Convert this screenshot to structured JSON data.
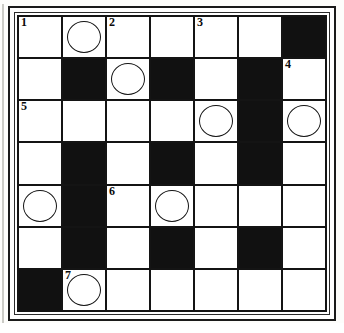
{
  "puzzle": {
    "title": "Crossword Grid",
    "type": "crossword",
    "rows": 7,
    "cols": 7,
    "colors": {
      "block": "#111111",
      "open": "#ffffff",
      "rule": "#141414",
      "number": "#0b0b0b"
    },
    "clue_numbers_visible": [
      "1",
      "2",
      "3",
      "4",
      "5",
      "6",
      "7"
    ],
    "cells": [
      [
        {
          "state": "open",
          "number": "1",
          "circled": false
        },
        {
          "state": "open",
          "number": "",
          "circled": true
        },
        {
          "state": "open",
          "number": "2",
          "circled": false
        },
        {
          "state": "open",
          "number": "",
          "circled": false
        },
        {
          "state": "open",
          "number": "3",
          "circled": false
        },
        {
          "state": "open",
          "number": "",
          "circled": false
        },
        {
          "state": "block",
          "number": "",
          "circled": false
        }
      ],
      [
        {
          "state": "open",
          "number": "",
          "circled": false
        },
        {
          "state": "block",
          "number": "",
          "circled": false
        },
        {
          "state": "open",
          "number": "",
          "circled": true
        },
        {
          "state": "block",
          "number": "",
          "circled": false
        },
        {
          "state": "open",
          "number": "",
          "circled": false
        },
        {
          "state": "block",
          "number": "",
          "circled": false
        },
        {
          "state": "open",
          "number": "4",
          "circled": false
        }
      ],
      [
        {
          "state": "open",
          "number": "5",
          "circled": false
        },
        {
          "state": "open",
          "number": "",
          "circled": false
        },
        {
          "state": "open",
          "number": "",
          "circled": false
        },
        {
          "state": "open",
          "number": "",
          "circled": false
        },
        {
          "state": "open",
          "number": "",
          "circled": true
        },
        {
          "state": "block",
          "number": "",
          "circled": false
        },
        {
          "state": "open",
          "number": "",
          "circled": true
        }
      ],
      [
        {
          "state": "open",
          "number": "",
          "circled": false
        },
        {
          "state": "block",
          "number": "",
          "circled": false
        },
        {
          "state": "open",
          "number": "",
          "circled": false
        },
        {
          "state": "block",
          "number": "",
          "circled": false
        },
        {
          "state": "open",
          "number": "",
          "circled": false
        },
        {
          "state": "block",
          "number": "",
          "circled": false
        },
        {
          "state": "open",
          "number": "",
          "circled": false
        }
      ],
      [
        {
          "state": "open",
          "number": "",
          "circled": true
        },
        {
          "state": "block",
          "number": "",
          "circled": false
        },
        {
          "state": "open",
          "number": "6",
          "circled": false
        },
        {
          "state": "open",
          "number": "",
          "circled": true
        },
        {
          "state": "open",
          "number": "",
          "circled": false
        },
        {
          "state": "open",
          "number": "",
          "circled": false
        },
        {
          "state": "open",
          "number": "",
          "circled": false
        }
      ],
      [
        {
          "state": "open",
          "number": "",
          "circled": false
        },
        {
          "state": "block",
          "number": "",
          "circled": false
        },
        {
          "state": "open",
          "number": "",
          "circled": false
        },
        {
          "state": "block",
          "number": "",
          "circled": false
        },
        {
          "state": "open",
          "number": "",
          "circled": false
        },
        {
          "state": "block",
          "number": "",
          "circled": false
        },
        {
          "state": "open",
          "number": "",
          "circled": false
        }
      ],
      [
        {
          "state": "block",
          "number": "",
          "circled": false
        },
        {
          "state": "open",
          "number": "7",
          "circled": true
        },
        {
          "state": "open",
          "number": "",
          "circled": false
        },
        {
          "state": "open",
          "number": "",
          "circled": false
        },
        {
          "state": "open",
          "number": "",
          "circled": false
        },
        {
          "state": "open",
          "number": "",
          "circled": false
        },
        {
          "state": "open",
          "number": "",
          "circled": false
        }
      ]
    ]
  }
}
